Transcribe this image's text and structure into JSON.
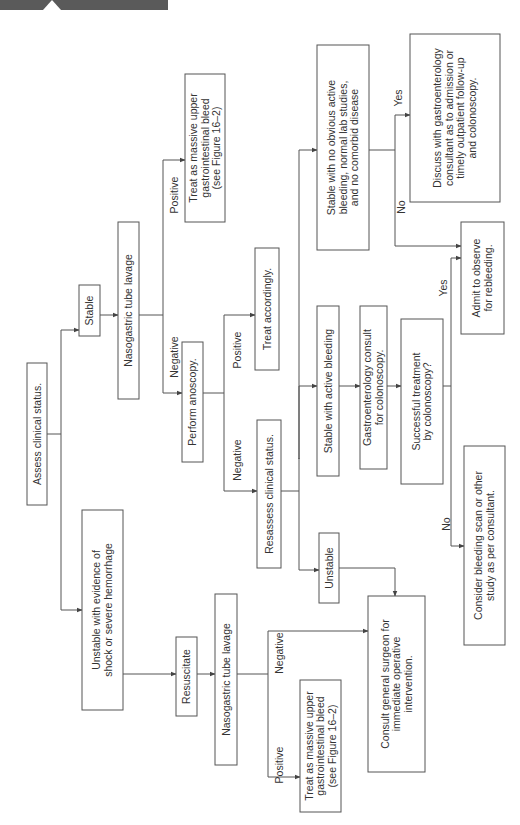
{
  "diagram": {
    "orientation": "rotated-90-ccw",
    "nodes": {
      "assess": [
        "Assess clinical status."
      ],
      "stable": [
        "Stable"
      ],
      "unstable_shock": [
        "Unstable with evidence of",
        "shock or severe hemorrhage"
      ],
      "ng_lavage_stable": [
        "Nasogastric tube lavage"
      ],
      "treat_massive_top": [
        "Treat as massive upper",
        "gastrointestinal bleed",
        "(see Figure 16–2)"
      ],
      "anoscopy": [
        "Perform anoscopy."
      ],
      "treat_accordingly": [
        "Treat accordingly."
      ],
      "reassess": [
        "Resassess clinical status."
      ],
      "stable_active": [
        "Stable with active bleeding"
      ],
      "unstable": [
        "Unstable"
      ],
      "gi_consult": [
        "Gastroenterology consult",
        "for colonoscopy."
      ],
      "successful": [
        "Successful treatment",
        "by colonoscopy?"
      ],
      "stable_no_bleeding": [
        "Stable with no obvious active",
        "bleeding, normal lab studies,",
        "and no comorbid disease"
      ],
      "discuss": [
        "Discuss with gastroenterology",
        "consultant as to admission or",
        "timely outpatient follow-up",
        "and colonoscopy."
      ],
      "admit": [
        "Admit to observe",
        "for rebleeding."
      ],
      "bleeding_scan": [
        "Consider bleeding scan or other",
        "study as per consultant."
      ],
      "resuscitate": [
        "Resuscitate"
      ],
      "ng_lavage_unstable": [
        "Nasogastric tube lavage"
      ],
      "treat_massive_bottom": [
        "Treat as massive upper",
        "gastrointestinal bleed",
        "(see Figure 16–2)"
      ],
      "consult_surgeon": [
        "Consult general surgeon for",
        "immediate operative",
        "intervention."
      ]
    },
    "edge_labels": {
      "positive_top": "Positive",
      "negative_top": "Negative",
      "positive_anoscopy": "Positive",
      "negative_anoscopy": "Negative",
      "yes_right": "Yes",
      "no_right": "No",
      "yes_success": "Yes",
      "no_success": "No",
      "positive_bottom": "Positive",
      "negative_bottom": "Negative"
    }
  }
}
